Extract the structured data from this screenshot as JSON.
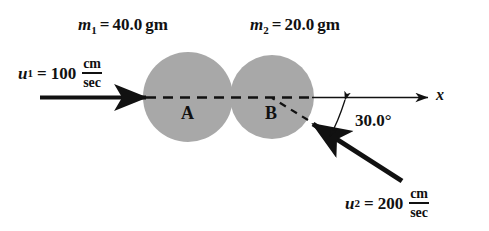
{
  "figure": {
    "background_color": "#ffffff",
    "ball_fill_color": "#a8a8a8",
    "line_color": "#111111"
  },
  "labels": {
    "mass1": {
      "symbol": "m",
      "subscript": "1",
      "equals": "=",
      "value": "40.0",
      "unit": "gm"
    },
    "mass2": {
      "symbol": "m",
      "subscript": "2",
      "equals": "=",
      "value": "20.0",
      "unit": "gm"
    },
    "velocity1": {
      "symbol": "u",
      "subscript": "1",
      "equals": "=",
      "value": "100",
      "unit_numerator": "cm",
      "unit_denominator": "sec"
    },
    "velocity2": {
      "symbol": "u",
      "subscript": "2",
      "equals": "=",
      "value": "200",
      "unit_numerator": "cm",
      "unit_denominator": "sec"
    },
    "angle": "30.0°",
    "axis": "x",
    "ball_a": "A",
    "ball_b": "B"
  },
  "geometry": {
    "ball_a_center_x": 188,
    "ball_a_center_y": 97,
    "ball_a_radius": 45,
    "ball_b_center_x": 272,
    "ball_b_center_y": 97,
    "ball_b_radius": 42,
    "axis_y": 97,
    "axis_end_x": 430,
    "incoming_arrow_start_x": 40,
    "incoming_arrow_end_x": 150,
    "angle_degrees": 30.0
  }
}
